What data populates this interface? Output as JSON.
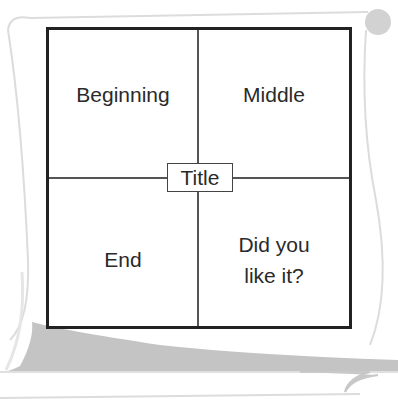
{
  "diagram": {
    "type": "four-quadrant story map on scroll",
    "quadrants": {
      "top_left": "Beginning",
      "top_right": "Middle",
      "bottom_left": "End",
      "bottom_right_line1": "Did you",
      "bottom_right_line2": "like it?"
    },
    "center_label": "Title"
  },
  "colors": {
    "scroll_outline": "#d9d9d9",
    "scroll_shade": "#c4c4c4",
    "grid_border": "#222222",
    "text": "#2a2a2a"
  }
}
